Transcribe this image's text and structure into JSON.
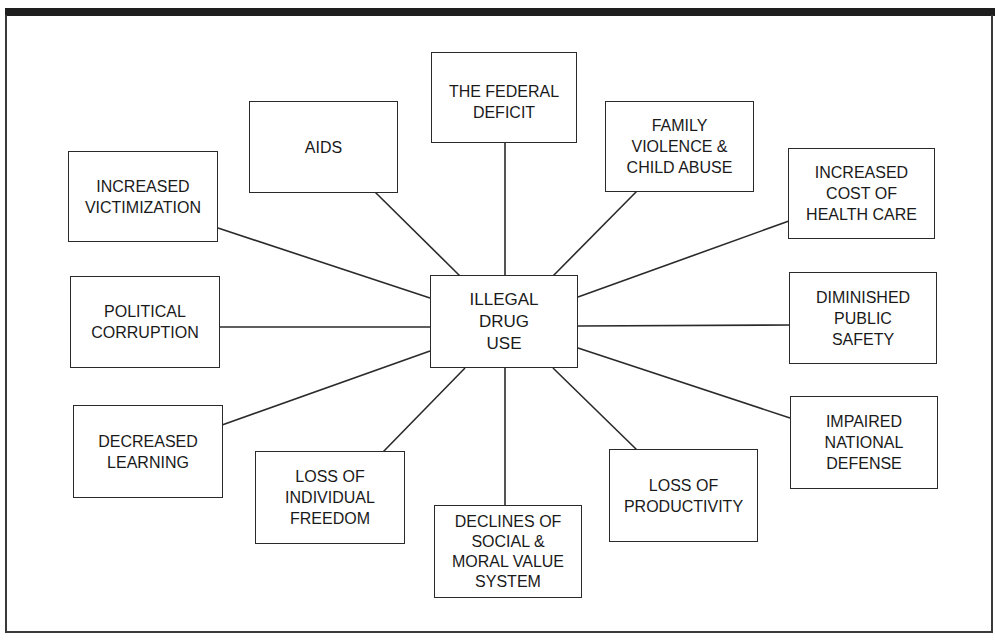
{
  "diagram": {
    "type": "hub-and-spoke",
    "center": {
      "id": "center",
      "label": "ILLEGAL\nDRUG\nUSE"
    },
    "nodes": [
      {
        "id": "federal_deficit",
        "label": "THE FEDERAL\nDEFICIT"
      },
      {
        "id": "aids",
        "label": "AIDS"
      },
      {
        "id": "family_violence",
        "label": "FAMILY\nVIOLENCE &\nCHILD ABUSE"
      },
      {
        "id": "increased_victimization",
        "label": "INCREASED\nVICTIMIZATION"
      },
      {
        "id": "health_care",
        "label": "INCREASED\nCOST OF\nHEALTH CARE"
      },
      {
        "id": "political_corruption",
        "label": "POLITICAL\nCORRUPTION"
      },
      {
        "id": "public_safety",
        "label": "DIMINISHED\nPUBLIC\nSAFETY"
      },
      {
        "id": "decreased_learning",
        "label": "DECREASED\nLEARNING"
      },
      {
        "id": "national_defense",
        "label": "IMPAIRED\nNATIONAL\nDEFENSE"
      },
      {
        "id": "individual_freedom",
        "label": "LOSS OF\nINDIVIDUAL\nFREEDOM"
      },
      {
        "id": "productivity",
        "label": "LOSS OF\nPRODUCTIVITY"
      },
      {
        "id": "social_moral",
        "label": "DECLINES OF\nSOCIAL &\nMORAL VALUE\nSYSTEM"
      }
    ],
    "edges": [
      [
        "center",
        "federal_deficit"
      ],
      [
        "center",
        "aids"
      ],
      [
        "center",
        "family_violence"
      ],
      [
        "center",
        "increased_victimization"
      ],
      [
        "center",
        "health_care"
      ],
      [
        "center",
        "political_corruption"
      ],
      [
        "center",
        "public_safety"
      ],
      [
        "center",
        "decreased_learning"
      ],
      [
        "center",
        "national_defense"
      ],
      [
        "center",
        "individual_freedom"
      ],
      [
        "center",
        "productivity"
      ],
      [
        "center",
        "social_moral"
      ]
    ]
  }
}
